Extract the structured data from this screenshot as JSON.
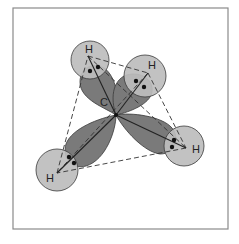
{
  "figure": {
    "frame": {
      "x": 13,
      "y": 8,
      "w": 215,
      "h": 221,
      "stroke": "#8a8a8a"
    },
    "colors": {
      "lobe_fill": "#7a7a7a",
      "h_orbital_fill": "#bdbdbd",
      "outline": "#3a3a3a",
      "electron": "#111111",
      "background": "#ffffff"
    },
    "carbon": {
      "label": "C",
      "x": 116,
      "y": 115,
      "label_x": 100,
      "label_y": 106
    },
    "atoms": [
      {
        "label": "H",
        "cx": 90,
        "cy": 60,
        "r": 19,
        "nx": 88,
        "ny": 56,
        "lx": 85,
        "ly": 53,
        "e1x": 90,
        "e1y": 71,
        "e2x": 98,
        "e2y": 67
      },
      {
        "label": "H",
        "cx": 145,
        "cy": 76,
        "r": 21,
        "nx": 148,
        "ny": 73,
        "lx": 148,
        "ly": 69,
        "e1x": 136,
        "e1y": 81,
        "e2x": 144,
        "e2y": 87
      },
      {
        "label": "H",
        "cx": 184,
        "cy": 146,
        "r": 20,
        "nx": 186,
        "ny": 148,
        "lx": 192,
        "ly": 153,
        "e1x": 174,
        "e1y": 140,
        "e2x": 172,
        "e2y": 147
      },
      {
        "label": "H",
        "cx": 57,
        "cy": 170,
        "r": 21,
        "nx": 57,
        "ny": 173,
        "lx": 46,
        "ly": 182,
        "e1x": 69,
        "e1y": 157,
        "e2x": 74,
        "e2y": 163
      }
    ],
    "lobes": [
      {
        "name": "lobe-top-left",
        "d": "M116,115 C106,108 80,100 80,82 C80,68 92,62 104,68 C116,76 120,100 116,115 Z"
      },
      {
        "name": "lobe-top-right",
        "d": "M116,115 C112,104 110,84 124,76 C138,70 154,78 152,92 C150,104 130,112 116,115 Z"
      },
      {
        "name": "lobe-right",
        "d": "M116,115 C130,112 162,116 172,128 C180,138 176,154 160,154 C144,152 124,130 116,115 Z"
      },
      {
        "name": "lobe-bottom-left",
        "d": "M116,115 C116,130 106,160 86,166 C72,170 62,158 66,144 C72,128 100,118 116,115 Z"
      }
    ],
    "tetra_edges": [
      [
        88,
        56,
        148,
        73
      ],
      [
        148,
        73,
        186,
        148
      ],
      [
        186,
        148,
        57,
        173
      ],
      [
        57,
        173,
        88,
        56
      ],
      [
        88,
        56,
        186,
        148
      ],
      [
        148,
        73,
        57,
        173
      ]
    ]
  }
}
